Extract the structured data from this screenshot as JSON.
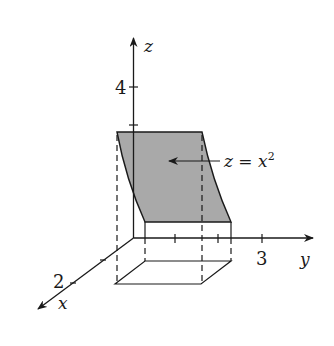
{
  "figure": {
    "surface_label": {
      "lhs": "z",
      "eq": " = ",
      "rhs": "x",
      "exp": "2"
    },
    "axes": {
      "z": {
        "label": "z",
        "tick_label": "4"
      },
      "y": {
        "label": "y",
        "tick_label": "3"
      },
      "x": {
        "label": "x",
        "tick_label": "2"
      }
    },
    "colors": {
      "surface_fill": "#a9a9a9",
      "line": "#1a1a1a"
    }
  }
}
